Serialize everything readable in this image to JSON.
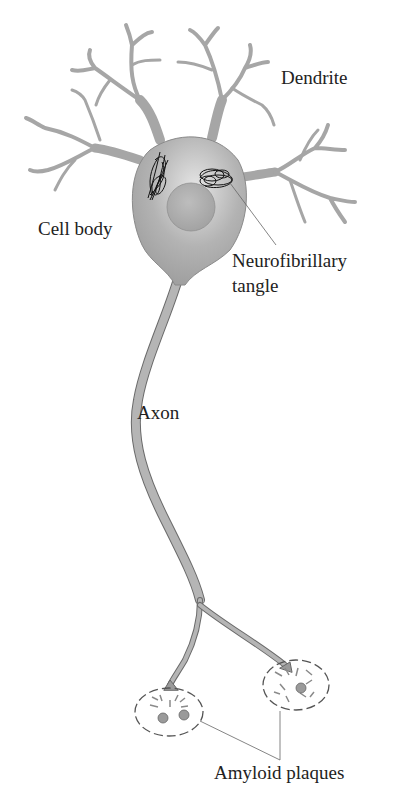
{
  "diagram": {
    "labels": {
      "dendrite": "Dendrite",
      "cell_body": "Cell body",
      "tangle_line1": "Neurofibrillary",
      "tangle_line2": "tangle",
      "axon": "Axon",
      "plaques": "Amyloid plaques"
    },
    "colors": {
      "neuron_fill": "#a6a6a6",
      "neuron_highlight": "#dedede",
      "outline": "#5a5a5a",
      "tangle": "#111111",
      "leader_line": "#555555"
    }
  }
}
